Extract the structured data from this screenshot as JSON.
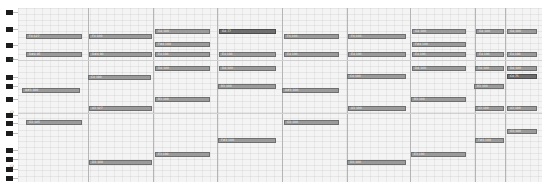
{
  "app": {
    "view": "piano-roll"
  },
  "colors": {
    "note_fill": "#9a9a9a",
    "note_border": "#6f6f6f",
    "note_selected": "#6e6e6e",
    "grid_bg": "#f4f4f4",
    "bar_line": "#b5b5b5",
    "black_key": "#1c1c1c"
  },
  "keys": {
    "black_key_y": [
      10,
      27,
      43,
      57,
      75,
      84,
      97,
      113,
      121,
      131,
      148,
      157,
      167,
      176
    ],
    "octave_labels": [
      {
        "y": 57,
        "text": "C4"
      },
      {
        "y": 110,
        "text": "C3"
      },
      {
        "y": 164,
        "text": "C2"
      }
    ]
  },
  "grid": {
    "bar_lines_x": [
      88,
      153,
      217,
      282,
      347,
      410,
      475,
      505
    ],
    "octave_lines_y": [
      60,
      113
    ]
  },
  "notes": [
    {
      "x": 26,
      "y": 34,
      "w": 56,
      "label": "F4 127"
    },
    {
      "x": 26,
      "y": 52,
      "w": 56,
      "label": "D#4 95"
    },
    {
      "x": 22,
      "y": 88,
      "w": 58,
      "label": "A#3 100"
    },
    {
      "x": 26,
      "y": 120,
      "w": 56,
      "label": "G3 105"
    },
    {
      "x": 89,
      "y": 34,
      "w": 63,
      "label": "F4 100"
    },
    {
      "x": 89,
      "y": 52,
      "w": 63,
      "label": "D#4 90"
    },
    {
      "x": 88,
      "y": 75,
      "w": 63,
      "label": "C4 100"
    },
    {
      "x": 89,
      "y": 106,
      "w": 63,
      "label": "A3 127"
    },
    {
      "x": 89,
      "y": 160,
      "w": 63,
      "label": "D3 100"
    },
    {
      "x": 155,
      "y": 29,
      "w": 55,
      "label": "G4 100"
    },
    {
      "x": 155,
      "y": 42,
      "w": 55,
      "label": "F#4 100"
    },
    {
      "x": 155,
      "y": 52,
      "w": 55,
      "label": "E4 100"
    },
    {
      "x": 155,
      "y": 66,
      "w": 55,
      "label": "D4 100"
    },
    {
      "x": 155,
      "y": 97,
      "w": 55,
      "label": "B3 100"
    },
    {
      "x": 155,
      "y": 152,
      "w": 55,
      "label": "E3 100"
    },
    {
      "x": 219,
      "y": 29,
      "w": 57,
      "label": "G4 77",
      "dark": true
    },
    {
      "x": 219,
      "y": 52,
      "w": 57,
      "label": "E4 100"
    },
    {
      "x": 219,
      "y": 66,
      "w": 57,
      "label": "D4 100"
    },
    {
      "x": 218,
      "y": 84,
      "w": 58,
      "label": "B3 100"
    },
    {
      "x": 218,
      "y": 138,
      "w": 58,
      "label": "F#3 100"
    },
    {
      "x": 284,
      "y": 34,
      "w": 55,
      "label": "F4 100"
    },
    {
      "x": 284,
      "y": 52,
      "w": 55,
      "label": "E4 100"
    },
    {
      "x": 282,
      "y": 88,
      "w": 57,
      "label": "A#3 100"
    },
    {
      "x": 284,
      "y": 120,
      "w": 55,
      "label": "G3 100"
    },
    {
      "x": 348,
      "y": 34,
      "w": 58,
      "label": "F4 100"
    },
    {
      "x": 348,
      "y": 52,
      "w": 58,
      "label": "E4 100"
    },
    {
      "x": 347,
      "y": 74,
      "w": 59,
      "label": "C4 100"
    },
    {
      "x": 348,
      "y": 106,
      "w": 58,
      "label": "A3 100"
    },
    {
      "x": 347,
      "y": 160,
      "w": 59,
      "label": "D3 100"
    },
    {
      "x": 412,
      "y": 29,
      "w": 54,
      "label": "G4 100"
    },
    {
      "x": 412,
      "y": 42,
      "w": 54,
      "label": "F#4 100"
    },
    {
      "x": 412,
      "y": 52,
      "w": 54,
      "label": "E4 100"
    },
    {
      "x": 412,
      "y": 66,
      "w": 54,
      "label": "D4 100"
    },
    {
      "x": 411,
      "y": 97,
      "w": 55,
      "label": "B3 100"
    },
    {
      "x": 411,
      "y": 152,
      "w": 55,
      "label": "E3 100"
    },
    {
      "x": 476,
      "y": 29,
      "w": 28,
      "label": "G4 100"
    },
    {
      "x": 476,
      "y": 52,
      "w": 28,
      "label": "E4 100"
    },
    {
      "x": 475,
      "y": 66,
      "w": 29,
      "label": "D4 100"
    },
    {
      "x": 474,
      "y": 84,
      "w": 30,
      "label": "B3 100"
    },
    {
      "x": 475,
      "y": 106,
      "w": 29,
      "label": "A3 100"
    },
    {
      "x": 475,
      "y": 138,
      "w": 29,
      "label": "F#3 100"
    },
    {
      "x": 507,
      "y": 29,
      "w": 30,
      "label": "G4 100"
    },
    {
      "x": 507,
      "y": 52,
      "w": 30,
      "label": "E4 100"
    },
    {
      "x": 507,
      "y": 66,
      "w": 30,
      "label": "D4 100"
    },
    {
      "x": 507,
      "y": 74,
      "w": 30,
      "label": "C4 75",
      "dark": true
    },
    {
      "x": 507,
      "y": 106,
      "w": 30,
      "label": "A3 100"
    },
    {
      "x": 507,
      "y": 129,
      "w": 30,
      "label": "G3 100"
    }
  ]
}
